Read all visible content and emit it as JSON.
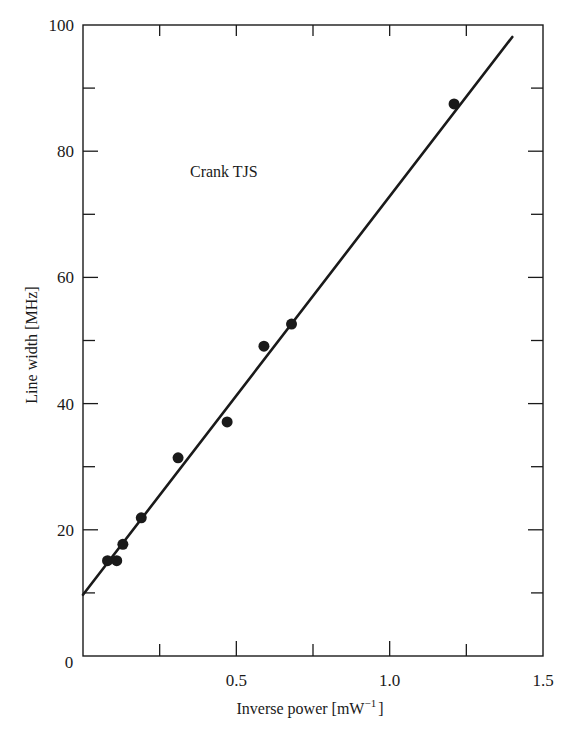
{
  "chart_data": {
    "type": "scatter",
    "title": "",
    "annotation": "Crank TJS",
    "xlabel": "Inverse power [mW",
    "xlabel_sup": "−1",
    "xlabel_end": "]",
    "ylabel": "Line width [MHz]",
    "xlim": [
      0,
      1.5
    ],
    "ylim": [
      0,
      100
    ],
    "xticks": [
      {
        "value": 0,
        "label": "0"
      },
      {
        "value": 0.5,
        "label": "0.5"
      },
      {
        "value": 1.0,
        "label": "1.0"
      },
      {
        "value": 1.5,
        "label": "1.5"
      }
    ],
    "yticks": [
      {
        "value": 0,
        "label": "0"
      },
      {
        "value": 20,
        "label": "20"
      },
      {
        "value": 40,
        "label": "40"
      },
      {
        "value": 60,
        "label": "60"
      },
      {
        "value": 80,
        "label": "80"
      },
      {
        "value": 100,
        "label": "100"
      }
    ],
    "x_minor_ticks": [
      0.25,
      0.75,
      1.25
    ],
    "y_minor_ticks": [
      10,
      30,
      50,
      70,
      90
    ],
    "grid": false,
    "legend": null,
    "series": [
      {
        "name": "Measured line width",
        "kind": "points",
        "points": [
          {
            "x": 0.08,
            "y": 15.1
          },
          {
            "x": 0.11,
            "y": 15.1
          },
          {
            "x": 0.13,
            "y": 17.7
          },
          {
            "x": 0.19,
            "y": 21.9
          },
          {
            "x": 0.31,
            "y": 31.4
          },
          {
            "x": 0.47,
            "y": 37.1
          },
          {
            "x": 0.59,
            "y": 49.1
          },
          {
            "x": 0.68,
            "y": 52.6
          },
          {
            "x": 1.21,
            "y": 87.5
          }
        ]
      },
      {
        "name": "Linear fit",
        "kind": "line",
        "points": [
          {
            "x": 0.0,
            "y": 9.7
          },
          {
            "x": 1.4,
            "y": 98.1
          }
        ]
      }
    ]
  },
  "colors": {
    "ink": "#1a1a1a",
    "background": "#ffffff"
  }
}
